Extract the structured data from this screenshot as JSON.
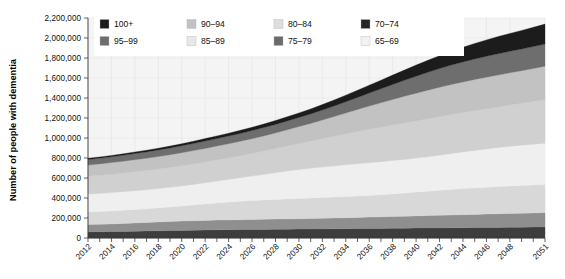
{
  "chart_data": {
    "type": "area",
    "stacked": true,
    "title": "",
    "subtitle": "",
    "xlabel": "",
    "ylabel": "Number of people with dementia",
    "ylim": [
      0,
      2200000
    ],
    "ytick_labels": [
      "0",
      "200,000",
      "400,000",
      "600,000",
      "800,000",
      "1,000,000",
      "1,200,000",
      "1,400,000",
      "1,600,000",
      "1,800,000",
      "2,000,000",
      "2,200,000"
    ],
    "ytick_values": [
      0,
      200000,
      400000,
      600000,
      800000,
      1000000,
      1200000,
      1400000,
      1600000,
      1800000,
      2000000,
      2200000
    ],
    "grid": true,
    "legend_position": "top-inside",
    "x": [
      2012,
      2013,
      2014,
      2015,
      2016,
      2017,
      2018,
      2019,
      2020,
      2021,
      2022,
      2023,
      2024,
      2025,
      2026,
      2027,
      2028,
      2029,
      2030,
      2031,
      2032,
      2033,
      2034,
      2035,
      2036,
      2037,
      2038,
      2039,
      2040,
      2041,
      2042,
      2043,
      2044,
      2045,
      2046,
      2047,
      2048,
      2049,
      2050,
      2051
    ],
    "xtick_labels": [
      "2012",
      "2014",
      "2016",
      "2018",
      "2020",
      "2022",
      "2024",
      "2026",
      "2028",
      "2030",
      "2032",
      "2034",
      "2036",
      "2038",
      "2040",
      "2042",
      "2044",
      "2046",
      "2048",
      "2051"
    ],
    "xtick_values": [
      2012,
      2014,
      2016,
      2018,
      2020,
      2022,
      2024,
      2026,
      2028,
      2030,
      2032,
      2034,
      2036,
      2038,
      2040,
      2042,
      2044,
      2046,
      2048,
      2051
    ],
    "stack_order_bottom_to_top": [
      "65-69",
      "70-74",
      "75-79",
      "80-84",
      "85-89",
      "90-94",
      "95-99",
      "100+"
    ],
    "series": [
      {
        "name": "65-69",
        "color": "#3d3d3d",
        "values": [
          62000,
          63000,
          64000,
          66000,
          68000,
          70000,
          72000,
          74000,
          76000,
          78000,
          80000,
          82000,
          83000,
          84000,
          85000,
          86000,
          87000,
          88000,
          89000,
          90000,
          91000,
          92000,
          93000,
          94000,
          95000,
          96000,
          97000,
          98000,
          99000,
          100000,
          101000,
          102000,
          103000,
          104000,
          105000,
          106000,
          107000,
          108000,
          109000,
          110000
        ]
      },
      {
        "name": "70-74",
        "color": "#8f8f8f",
        "values": [
          72000,
          74000,
          77000,
          80000,
          83000,
          86000,
          89000,
          91000,
          93000,
          95000,
          96000,
          97000,
          98000,
          99000,
          100000,
          101000,
          102000,
          103000,
          104000,
          105000,
          106000,
          108000,
          110000,
          112000,
          114000,
          116000,
          118000,
          120000,
          122000,
          124000,
          126000,
          128000,
          130000,
          132000,
          134000,
          136000,
          138000,
          140000,
          142000,
          144000
        ]
      },
      {
        "name": "75-79",
        "color": "#d8d8d8",
        "values": [
          125000,
          127000,
          129000,
          131000,
          134000,
          137000,
          141000,
          146000,
          152000,
          158000,
          165000,
          172000,
          178000,
          184000,
          189000,
          193000,
          197000,
          200000,
          203000,
          205000,
          207000,
          209000,
          211000,
          214000,
          217000,
          221000,
          226000,
          232000,
          238000,
          244000,
          250000,
          256000,
          261000,
          265000,
          269000,
          272000,
          275000,
          277000,
          279000,
          281000
        ]
      },
      {
        "name": "80-84",
        "color": "#efefef",
        "values": [
          180000,
          182000,
          184000,
          186000,
          188000,
          190000,
          193000,
          196000,
          200000,
          205000,
          211000,
          218000,
          226000,
          235000,
          245000,
          256000,
          267000,
          278000,
          288000,
          297000,
          305000,
          312000,
          318000,
          323000,
          327000,
          330000,
          333000,
          336000,
          340000,
          345000,
          351000,
          358000,
          366000,
          374000,
          382000,
          390000,
          397000,
          403000,
          408000,
          412000
        ]
      },
      {
        "name": "85-89",
        "color": "#d0d0d0",
        "values": [
          178000,
          181000,
          184000,
          187000,
          190000,
          193000,
          196000,
          199000,
          202000,
          205000,
          208000,
          211000,
          215000,
          220000,
          226000,
          233000,
          241000,
          250000,
          260000,
          271000,
          283000,
          296000,
          309000,
          322000,
          334000,
          345000,
          355000,
          364000,
          372000,
          379000,
          385000,
          390000,
          394000,
          398000,
          402000,
          407000,
          413000,
          420000,
          428000,
          437000
        ]
      },
      {
        "name": "90-94",
        "color": "#c2c2c2",
        "values": [
          112000,
          114000,
          116000,
          118000,
          120000,
          122000,
          124000,
          127000,
          130000,
          133000,
          136000,
          139000,
          142000,
          145000,
          148000,
          152000,
          157000,
          163000,
          170000,
          178000,
          187000,
          197000,
          208000,
          220000,
          232000,
          244000,
          256000,
          267000,
          277000,
          286000,
          294000,
          301000,
          307000,
          312000,
          316000,
          319000,
          322000,
          325000,
          329000,
          334000
        ]
      },
      {
        "name": "95-99",
        "color": "#6e6e6e",
        "values": [
          56000,
          57000,
          58000,
          59000,
          61000,
          63000,
          65000,
          67000,
          69000,
          71000,
          73000,
          75000,
          77000,
          79000,
          81000,
          83000,
          85000,
          88000,
          91000,
          95000,
          100000,
          106000,
          113000,
          121000,
          130000,
          140000,
          150000,
          160000,
          170000,
          179000,
          187000,
          194000,
          200000,
          205000,
          209000,
          212000,
          215000,
          217000,
          219000,
          221000
        ]
      },
      {
        "name": "100+",
        "color": "#1c1c1c",
        "values": [
          12000,
          13000,
          14000,
          15000,
          16000,
          17000,
          18000,
          19000,
          21000,
          23000,
          25000,
          27000,
          29000,
          31000,
          33000,
          36000,
          39000,
          42000,
          46000,
          50000,
          55000,
          60000,
          66000,
          72000,
          79000,
          86000,
          94000,
          102000,
          111000,
          120000,
          129000,
          138000,
          147000,
          156000,
          164000,
          172000,
          179000,
          186000,
          193000,
          200000
        ]
      }
    ],
    "legend_entries": [
      {
        "label": "100+",
        "color": "#1c1c1c"
      },
      {
        "label": "90–94",
        "color": "#c2c2c2"
      },
      {
        "label": "80–84",
        "color": "#dedede"
      },
      {
        "label": "70–74",
        "color": "#262626"
      },
      {
        "label": "95–99",
        "color": "#6e6e6e"
      },
      {
        "label": "85–89",
        "color": "#e8e8e8"
      },
      {
        "label": "75–79",
        "color": "#6b6b6b"
      },
      {
        "label": "65–69",
        "color": "#f2f2f2"
      }
    ]
  }
}
